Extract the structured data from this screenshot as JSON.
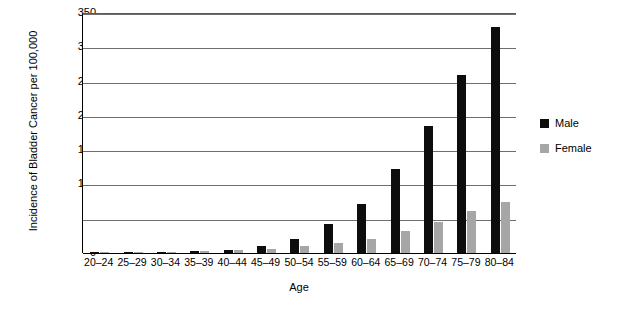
{
  "chart_data": {
    "type": "bar",
    "title": "",
    "xlabel": "Age",
    "ylabel": "Incidence of Bladder Cancer per 100,000",
    "categories": [
      "20–24",
      "25–29",
      "30–34",
      "35–39",
      "40–44",
      "45–49",
      "50–54",
      "55–59",
      "60–64",
      "65–69",
      "70–74",
      "75–79",
      "80–84"
    ],
    "series": [
      {
        "name": "Male",
        "color": "#0d0d0d",
        "values": [
          1,
          1,
          2,
          3,
          5,
          10,
          20,
          42,
          71,
          123,
          185,
          259,
          330
        ]
      },
      {
        "name": "Female",
        "color": "#a6a6a6",
        "values": [
          2,
          2,
          2,
          3,
          4,
          6,
          10,
          14,
          21,
          32,
          45,
          61,
          74
        ]
      }
    ],
    "ylim": [
      0,
      350
    ],
    "yticks": [
      0,
      50,
      100,
      150,
      200,
      250,
      300,
      350
    ],
    "grid": true,
    "legend_position": "right"
  },
  "legend": {
    "items": [
      {
        "label": "Male",
        "color": "#0d0d0d"
      },
      {
        "label": "Female",
        "color": "#a6a6a6"
      }
    ]
  }
}
